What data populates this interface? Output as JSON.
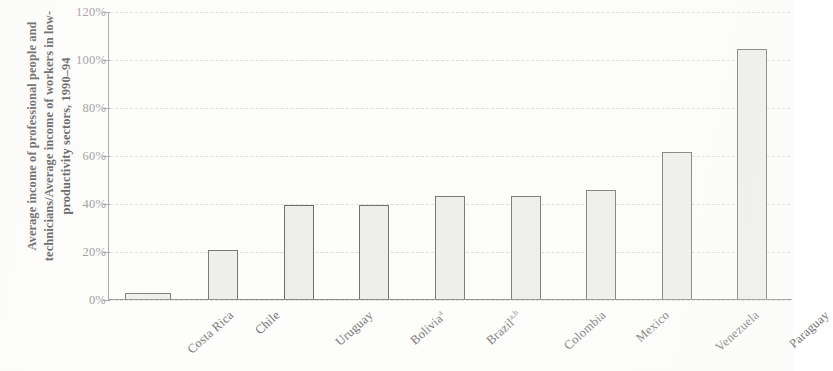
{
  "chart_data": {
    "type": "bar",
    "title": "",
    "subtitle": "",
    "xlabel": "",
    "ylabel": "Average income of professional people and technicians/Average income of workers in low-productivity sectors, 1990–94",
    "ylim": [
      0,
      120
    ],
    "ytick_values": [
      0,
      20,
      40,
      60,
      80,
      100,
      120
    ],
    "ytick_labels": [
      "0%",
      "20%",
      "40%",
      "60%",
      "80%",
      "100%",
      "120%"
    ],
    "grid": true,
    "legend": "none",
    "categories": [
      "Costa Rica",
      "Chile",
      "Uruguay",
      "Bolivia",
      "Brazil",
      "Colombia",
      "Mexico",
      "Venezuela",
      "Paraguay"
    ],
    "category_footnotes": [
      "",
      "",
      "",
      "a",
      "a,b",
      "",
      "",
      "",
      ""
    ],
    "values": [
      2.5,
      21,
      39.5,
      39.5,
      43.5,
      43.5,
      46,
      61.5,
      104.5
    ],
    "value_unit": "%",
    "bar_fill_color": "#ededeb",
    "bar_border_color": "#6e6e6c",
    "gridline_color": "#d9d9d6",
    "axis_color": "#8a8a88",
    "text_color": "#6f6f6d"
  }
}
